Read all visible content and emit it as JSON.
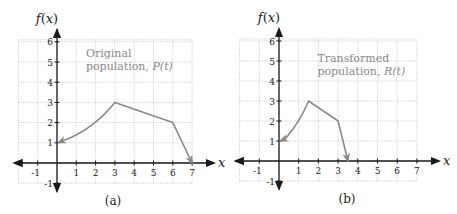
{
  "chart_data": [
    {
      "type": "line",
      "panel_label": "(a)",
      "ylabel": "f(x)",
      "xlabel": "x",
      "xlim": [
        -2,
        7
      ],
      "ylim": [
        -1,
        6
      ],
      "xticks": [
        -1,
        1,
        2,
        3,
        4,
        5,
        6,
        7
      ],
      "yticks": [
        -1,
        1,
        2,
        3,
        4,
        5,
        6
      ],
      "grid": true,
      "annotation": {
        "line1": "Original",
        "line2_prefix": "population, ",
        "line2_func": "P(t)"
      },
      "series": [
        {
          "name": "Original population, P(t)",
          "color": "#8a8a8a",
          "segments": [
            {
              "kind": "curve",
              "points": [
                [
                  0,
                  1
                ],
                [
                  1,
                  1.35
                ],
                [
                  2,
                  1.9
                ],
                [
                  3,
                  3
                ]
              ]
            },
            {
              "kind": "line",
              "points": [
                [
                  3,
                  3
                ],
                [
                  6,
                  2
                ]
              ]
            },
            {
              "kind": "line",
              "points": [
                [
                  6,
                  2
                ],
                [
                  7,
                  0
                ]
              ]
            }
          ],
          "key_points": [
            [
              0,
              1
            ],
            [
              3,
              3
            ],
            [
              6,
              2
            ],
            [
              7,
              0
            ]
          ]
        }
      ]
    },
    {
      "type": "line",
      "panel_label": "(b)",
      "ylabel": "f(x)",
      "xlabel": "x",
      "xlim": [
        -2,
        7
      ],
      "ylim": [
        -1,
        6
      ],
      "xticks": [
        -1,
        1,
        2,
        3,
        4,
        5,
        6,
        7
      ],
      "yticks": [
        -1,
        1,
        2,
        3,
        4,
        5,
        6
      ],
      "grid": true,
      "annotation": {
        "line1": "Transformed",
        "line2_prefix": "population, ",
        "line2_func": "R(t)"
      },
      "series": [
        {
          "name": "Transformed population, R(t)",
          "color": "#8a8a8a",
          "segments": [
            {
              "kind": "curve",
              "points": [
                [
                  0,
                  1
                ],
                [
                  0.5,
                  1.35
                ],
                [
                  1,
                  1.9
                ],
                [
                  1.5,
                  3
                ]
              ]
            },
            {
              "kind": "line",
              "points": [
                [
                  1.5,
                  3
                ],
                [
                  3,
                  2
                ]
              ]
            },
            {
              "kind": "line",
              "points": [
                [
                  3,
                  2
                ],
                [
                  3.5,
                  0
                ]
              ]
            }
          ],
          "key_points": [
            [
              0,
              1
            ],
            [
              1.5,
              3
            ],
            [
              3,
              2
            ],
            [
              3.5,
              0
            ]
          ]
        }
      ]
    }
  ]
}
